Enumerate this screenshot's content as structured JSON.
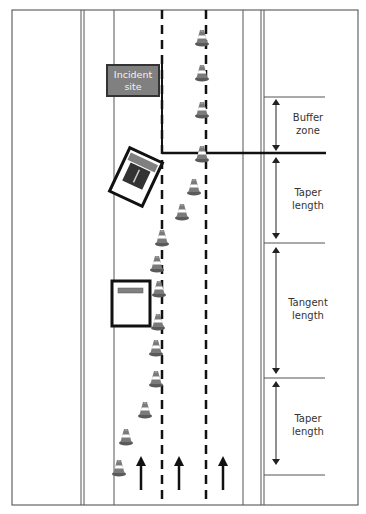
{
  "diagram": {
    "incident_label": "Incident site",
    "incident_label_lines": [
      "Incident",
      "site"
    ],
    "zones": [
      {
        "id": "buffer",
        "lines": [
          "Buffer",
          "zone"
        ],
        "top": 97,
        "bottom": 153
      },
      {
        "id": "taper-1",
        "lines": [
          "Taper",
          "length"
        ],
        "top": 153,
        "bottom": 243
      },
      {
        "id": "tangent",
        "lines": [
          "Tangent",
          "length"
        ],
        "top": 243,
        "bottom": 378
      },
      {
        "id": "taper-2",
        "lines": [
          "Taper",
          "length"
        ],
        "top": 378,
        "bottom": 475
      }
    ],
    "lanes": 3,
    "direction": "northbound",
    "cone_icon": "traffic-cone-icon",
    "arrow_icon": "arrow-up-icon",
    "colors": {
      "line": "#333333",
      "incident_fill": "#808080",
      "cone": "#6e6e6e",
      "vehicle_stripe": "#808080"
    }
  }
}
